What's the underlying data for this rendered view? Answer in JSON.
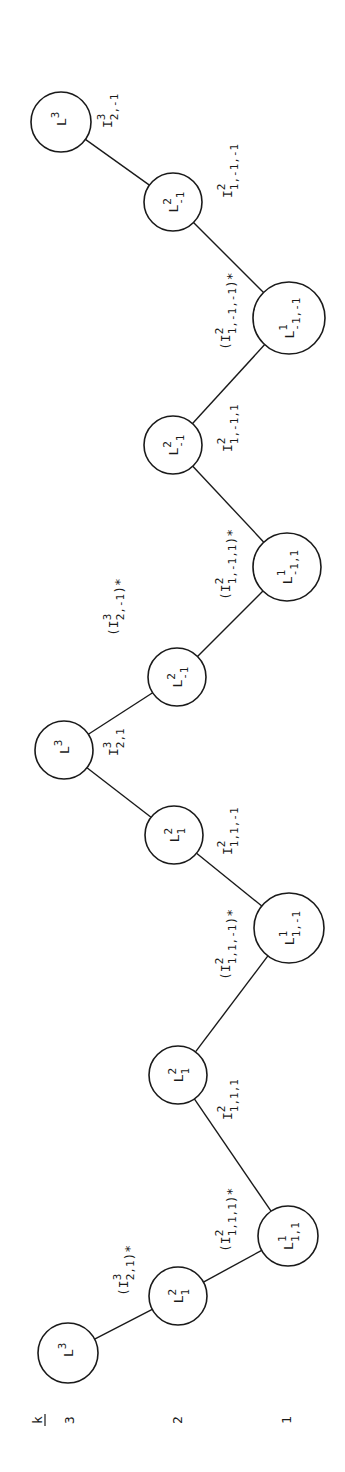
{
  "diagram": {
    "axis": {
      "title": "k",
      "levels": [
        {
          "label": "3",
          "x": 70
        },
        {
          "label": "2",
          "x": 178
        },
        {
          "label": "1",
          "x": 287
        }
      ]
    },
    "nodes": [
      {
        "id": "n1",
        "base": "L",
        "sup": "3",
        "sub": "",
        "cx": 61,
        "cy": 122,
        "r": 30,
        "level": 3
      },
      {
        "id": "n2",
        "base": "L",
        "sup": "2",
        "sub": "-1",
        "cx": 173,
        "cy": 202,
        "r": 29,
        "level": 2
      },
      {
        "id": "n3",
        "base": "L",
        "sup": "1",
        "sub": "-1,-1",
        "cx": 289,
        "cy": 318,
        "r": 36,
        "level": 1
      },
      {
        "id": "n4",
        "base": "L",
        "sup": "2",
        "sub": "-1",
        "cx": 173,
        "cy": 445,
        "r": 29,
        "level": 2
      },
      {
        "id": "n5",
        "base": "L",
        "sup": "1",
        "sub": "-1,1",
        "cx": 287,
        "cy": 567,
        "r": 34,
        "level": 1
      },
      {
        "id": "n6",
        "base": "L",
        "sup": "2",
        "sub": "-1",
        "cx": 177,
        "cy": 677,
        "r": 29,
        "level": 2
      },
      {
        "id": "n7",
        "base": "L",
        "sup": "3",
        "sub": "",
        "cx": 64,
        "cy": 750,
        "r": 29,
        "level": 3
      },
      {
        "id": "n8",
        "base": "L",
        "sup": "2",
        "sub": "1",
        "cx": 174,
        "cy": 835,
        "r": 29,
        "level": 2
      },
      {
        "id": "n9",
        "base": "L",
        "sup": "1",
        "sub": "1,-1",
        "cx": 289,
        "cy": 928,
        "r": 35,
        "level": 1
      },
      {
        "id": "n10",
        "base": "L",
        "sup": "2",
        "sub": "1",
        "cx": 178,
        "cy": 1075,
        "r": 29,
        "level": 2
      },
      {
        "id": "n11",
        "base": "L",
        "sup": "1",
        "sub": "1,1",
        "cx": 288,
        "cy": 1236,
        "r": 30,
        "level": 1
      },
      {
        "id": "n12",
        "base": "L",
        "sup": "2",
        "sub": "1",
        "cx": 178,
        "cy": 1296,
        "r": 29,
        "level": 2
      },
      {
        "id": "n13",
        "base": "L",
        "sup": "3",
        "sub": "",
        "cx": 68,
        "cy": 1353,
        "r": 30,
        "level": 3
      }
    ],
    "edges": [
      {
        "from": "n1",
        "to": "n2",
        "label": {
          "open": "",
          "base": "I",
          "sup": "3",
          "sub": "2,-1",
          "close": "",
          "x": 112,
          "y": 128
        }
      },
      {
        "from": "n2",
        "to": "n3",
        "label": {
          "open": "",
          "base": "I",
          "sup": "2",
          "sub": "1,-1,-1",
          "close": "",
          "x": 232,
          "y": 198
        }
      },
      {
        "from": "n3",
        "to": "n4",
        "label": {
          "open": "(",
          "base": "I",
          "sup": "2",
          "sub": "1,-1,-1",
          "close": ")*",
          "x": 230,
          "y": 350
        }
      },
      {
        "from": "n4",
        "to": "n5",
        "label": {
          "open": "",
          "base": "I",
          "sup": "2",
          "sub": "1,-1,1",
          "close": "",
          "x": 232,
          "y": 452
        }
      },
      {
        "from": "n5",
        "to": "n6",
        "label": {
          "open": "(",
          "base": "I",
          "sup": "2",
          "sub": "1,-1,1",
          "close": ")*",
          "x": 230,
          "y": 600
        }
      },
      {
        "from": "n6",
        "to": "n7",
        "label": {
          "open": "(",
          "base": "I",
          "sup": "3",
          "sub": "2,-1",
          "close": ")*",
          "x": 118,
          "y": 636
        }
      },
      {
        "from": "n7",
        "to": "n8",
        "label": {
          "open": "",
          "base": "I",
          "sup": "3",
          "sub": "2,1",
          "close": "",
          "x": 118,
          "y": 756
        }
      },
      {
        "from": "n8",
        "to": "n9",
        "label": {
          "open": "",
          "base": "I",
          "sup": "2",
          "sub": "1,1,-1",
          "close": "",
          "x": 232,
          "y": 855
        }
      },
      {
        "from": "n9",
        "to": "n10",
        "label": {
          "open": "(",
          "base": "I",
          "sup": "2",
          "sub": "1,1,-1",
          "close": ")*",
          "x": 230,
          "y": 980
        }
      },
      {
        "from": "n10",
        "to": "n11",
        "label": {
          "open": "",
          "base": "I",
          "sup": "2",
          "sub": "1,1,1",
          "close": "",
          "x": 232,
          "y": 1120
        }
      },
      {
        "from": "n11",
        "to": "n12",
        "label": {
          "open": "(",
          "base": "I",
          "sup": "2",
          "sub": "1,1,1",
          "close": ")*",
          "x": 230,
          "y": 1252
        }
      },
      {
        "from": "n12",
        "to": "n13",
        "label": {
          "open": "(",
          "base": "I",
          "sup": "3",
          "sub": "2,1",
          "close": ")*",
          "x": 128,
          "y": 1296
        }
      }
    ]
  }
}
